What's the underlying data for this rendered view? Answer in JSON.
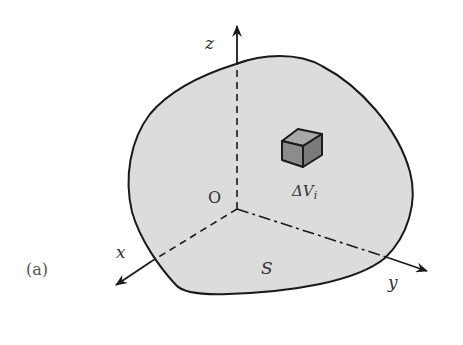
{
  "figure": {
    "panel_label": "(a)",
    "region_label": "S",
    "origin_label": "O",
    "axes": {
      "x": "x",
      "y": "y",
      "z": "z"
    },
    "element_label": {
      "main": "ΔV",
      "subscript": "i"
    },
    "colors": {
      "background": "#ffffff",
      "region_fill": "#dcdcdc",
      "outline": "#1a1a1a",
      "cube_front": "#8c8c8c",
      "cube_top": "#a8a8a8",
      "cube_side": "#7a7a7a"
    }
  }
}
